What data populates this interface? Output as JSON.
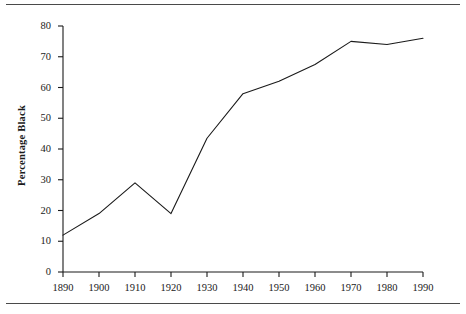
{
  "figure": {
    "has_top_rule": true,
    "has_bottom_rule": true,
    "background_color": "#ffffff",
    "line_color": "#1a1a1a",
    "axis_color": "#1a1a1a"
  },
  "chart_data": {
    "type": "line",
    "title": "",
    "xlabel": "",
    "ylabel": "Percentage Black",
    "x": [
      1890,
      1900,
      1910,
      1920,
      1930,
      1940,
      1950,
      1960,
      1970,
      1980,
      1990
    ],
    "values": [
      12,
      19,
      29,
      19,
      43.5,
      58,
      62,
      67.5,
      75,
      74,
      76
    ],
    "series": [
      {
        "name": "Percentage Black",
        "values": [
          12,
          19,
          29,
          19,
          43.5,
          58,
          62,
          67.5,
          75,
          74,
          76
        ]
      }
    ],
    "xlim": [
      1890,
      1990
    ],
    "ylim": [
      0,
      80
    ],
    "xticks": [
      1890,
      1900,
      1910,
      1920,
      1930,
      1940,
      1950,
      1960,
      1970,
      1980,
      1990
    ],
    "xtick_labels": [
      "1890",
      "1900",
      "1910",
      "1920",
      "1930",
      "1940",
      "1950",
      "1960",
      "1970",
      "1980",
      "1990"
    ],
    "yticks": [
      0,
      10,
      20,
      30,
      40,
      50,
      60,
      70,
      80
    ],
    "ytick_labels": [
      "0",
      "10",
      "20",
      "30",
      "40",
      "50",
      "60",
      "70",
      "80"
    ],
    "grid": false,
    "legend": false,
    "marker": "none"
  }
}
